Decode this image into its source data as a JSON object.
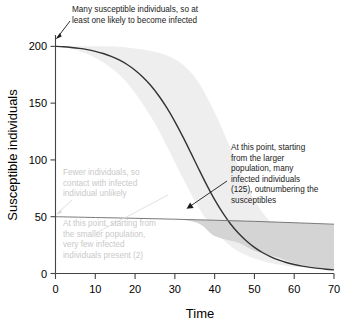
{
  "chart_data": {
    "type": "line",
    "title": "",
    "xlabel": "Time",
    "ylabel": "Susceptible individuals",
    "xlim": [
      0,
      70
    ],
    "ylim": [
      0,
      210
    ],
    "xticks": [
      0,
      10,
      20,
      30,
      40,
      50,
      60,
      70
    ],
    "yticks": [
      0,
      50,
      100,
      150,
      200
    ],
    "grid": false,
    "legend": "none",
    "series": [
      {
        "name": "Large population (N=200)",
        "color": "#333333",
        "x": [
          0,
          2,
          4,
          6,
          8,
          10,
          12,
          14,
          16,
          18,
          20,
          22,
          24,
          26,
          28,
          30,
          32,
          34,
          36,
          38,
          40,
          42,
          44,
          46,
          48,
          50,
          52,
          54,
          56,
          58,
          60,
          62,
          64,
          66,
          68,
          70
        ],
        "values": [
          200,
          199.6,
          199.0,
          198.2,
          197.1,
          195.6,
          193.7,
          191.2,
          188.0,
          184.0,
          179.0,
          172.8,
          165.3,
          156.3,
          145.8,
          133.8,
          120.5,
          106.4,
          92.0,
          78.0,
          65.0,
          53.5,
          43.6,
          35.4,
          28.6,
          23.0,
          18.5,
          14.9,
          12.0,
          9.7,
          7.9,
          6.5,
          5.4,
          4.5,
          3.8,
          3.2
        ]
      },
      {
        "name": "Small population (N=50)",
        "color": "#7a7a7a",
        "x": [
          0,
          10,
          20,
          30,
          40,
          50,
          60,
          70
        ],
        "values": [
          50,
          49.3,
          48.6,
          47.8,
          46.9,
          45.9,
          44.7,
          43.4
        ]
      }
    ],
    "bands": [
      {
        "name": "large-population-uncertainty",
        "color": "#eeeeee",
        "x": [
          0,
          6,
          12,
          18,
          24,
          28,
          32,
          36,
          40,
          44,
          48,
          52,
          56,
          60,
          64,
          70
        ],
        "lower": [
          200,
          196,
          186,
          168,
          138,
          112,
          84,
          58,
          38,
          24,
          16,
          11,
          8,
          6,
          5,
          4
        ],
        "upper": [
          200,
          200,
          200,
          199,
          196,
          192,
          184,
          168,
          142,
          110,
          78,
          54,
          38,
          28,
          22,
          18
        ]
      },
      {
        "name": "small-population-uncertainty",
        "color": "#d4d4d4",
        "x": [
          0,
          10,
          20,
          30,
          36,
          40,
          46,
          50,
          56,
          60,
          66,
          70
        ],
        "lower": [
          50,
          49.3,
          48.6,
          47.8,
          44,
          33,
          27,
          20,
          14,
          9,
          5,
          3
        ],
        "upper": [
          50,
          49.3,
          48.6,
          47.8,
          47.2,
          46.9,
          46.4,
          45.9,
          45.2,
          44.7,
          43.9,
          43.4
        ]
      }
    ],
    "annotations": [
      {
        "id": "anno-top",
        "style": "dark",
        "lines": [
          "Many susceptible individuals, so at",
          "least one likely to become infected"
        ],
        "points_to": [
          0,
          200
        ]
      },
      {
        "id": "anno-right",
        "style": "dark",
        "lines": [
          "At this point, starting",
          "from the larger",
          "population, many",
          "infected individuals",
          "(125), outnumbering the",
          "susceptibles"
        ],
        "points_to": [
          36,
          50
        ]
      },
      {
        "id": "anno-grey-upper",
        "style": "grey",
        "lines": [
          "Fewer individuals, so",
          "contact with infected",
          "individual unlikely"
        ],
        "points_to": [
          0,
          50
        ]
      },
      {
        "id": "anno-grey-lower",
        "style": "grey",
        "lines": [
          "At this point, starting from",
          "the smaller population,",
          "very few infected",
          "individuals present (2)"
        ],
        "points_to": [
          0,
          50
        ]
      }
    ]
  }
}
